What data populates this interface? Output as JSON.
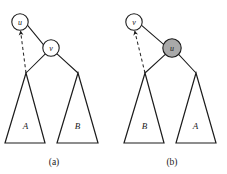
{
  "figure": {
    "type": "tree-rotation-diagram",
    "background_color": "#ffffff",
    "stroke_color": "#1c1c1c",
    "shaded_fill_color": "#a9a9a9",
    "plain_fill_color": "#ffffff"
  },
  "panels": [
    {
      "id": "a",
      "caption": "(a)",
      "caption_x": 54,
      "caption_y": 162,
      "nodes": [
        {
          "id": "a-node-u",
          "label": "u",
          "cx": 20,
          "cy": 22,
          "r": 8.2,
          "shaded": false
        },
        {
          "id": "a-node-v",
          "label": "v",
          "cx": 51,
          "cy": 48,
          "r": 8.2,
          "shaded": false
        }
      ],
      "edges": [
        {
          "id": "a-edge-u-v",
          "x1": 27.6,
          "y1": 25.4,
          "x2": 43.6,
          "y2": 44.8,
          "style": "solid"
        },
        {
          "id": "a-edge-v-subtreeA",
          "x1": 45.6,
          "y1": 53.6,
          "x2": 26.0,
          "y2": 73.0,
          "style": "solid"
        },
        {
          "id": "a-edge-v-subtreeB",
          "x1": 57.0,
          "y1": 53.8,
          "x2": 78.0,
          "y2": 73.0,
          "style": "solid"
        }
      ],
      "dashed_arrow": {
        "id": "a-dashed-arrow",
        "from_x": 26.0,
        "from_y": 73.0,
        "to_x": 20.6,
        "to_y": 31.4,
        "style": "dashed",
        "arrowhead_at": "target"
      },
      "subtrees": [
        {
          "id": "a-subtree-A",
          "label": "A",
          "apex_x": 26.0,
          "apex_y": 73.0,
          "base_left_x": 5.0,
          "base_right_x": 45.0,
          "base_y": 143.0,
          "label_x": 25.5,
          "label_y": 126.0
        },
        {
          "id": "a-subtree-B",
          "label": "B",
          "apex_x": 78.0,
          "apex_y": 73.0,
          "base_left_x": 57.0,
          "base_right_x": 98.0,
          "base_y": 143.0,
          "label_x": 77.5,
          "label_y": 126.0
        }
      ]
    },
    {
      "id": "b",
      "caption": "(b)",
      "caption_x": 172,
      "caption_y": 162,
      "nodes": [
        {
          "id": "b-node-v",
          "label": "v",
          "cx": 134,
          "cy": 22,
          "r": 8.2,
          "shaded": false
        },
        {
          "id": "b-node-u",
          "label": "u",
          "cx": 172,
          "cy": 48,
          "r": 9.2,
          "shaded": true
        }
      ],
      "edges": [
        {
          "id": "b-edge-v-u",
          "x1": 141.6,
          "y1": 25.4,
          "x2": 163.6,
          "y2": 44.4,
          "style": "solid"
        },
        {
          "id": "b-edge-u-subtreeB",
          "x1": 165.6,
          "y1": 54.2,
          "x2": 145.0,
          "y2": 73.0,
          "style": "solid"
        },
        {
          "id": "b-edge-u-subtreeA",
          "x1": 178.4,
          "y1": 54.2,
          "x2": 196.0,
          "y2": 73.0,
          "style": "solid"
        }
      ],
      "dashed_arrow": {
        "id": "b-dashed-arrow",
        "from_x": 145.0,
        "from_y": 73.0,
        "to_x": 134.8,
        "to_y": 31.4,
        "style": "dashed",
        "arrowhead_at": "target"
      },
      "subtrees": [
        {
          "id": "b-subtree-B",
          "label": "B",
          "apex_x": 145.0,
          "apex_y": 73.0,
          "base_left_x": 124.0,
          "base_right_x": 164.0,
          "base_y": 143.0,
          "label_x": 144.5,
          "label_y": 126.0
        },
        {
          "id": "b-subtree-A",
          "label": "A",
          "apex_x": 196.0,
          "apex_y": 73.0,
          "base_left_x": 176.0,
          "base_right_x": 216.0,
          "base_y": 143.0,
          "label_x": 195.5,
          "label_y": 126.0
        }
      ]
    }
  ]
}
